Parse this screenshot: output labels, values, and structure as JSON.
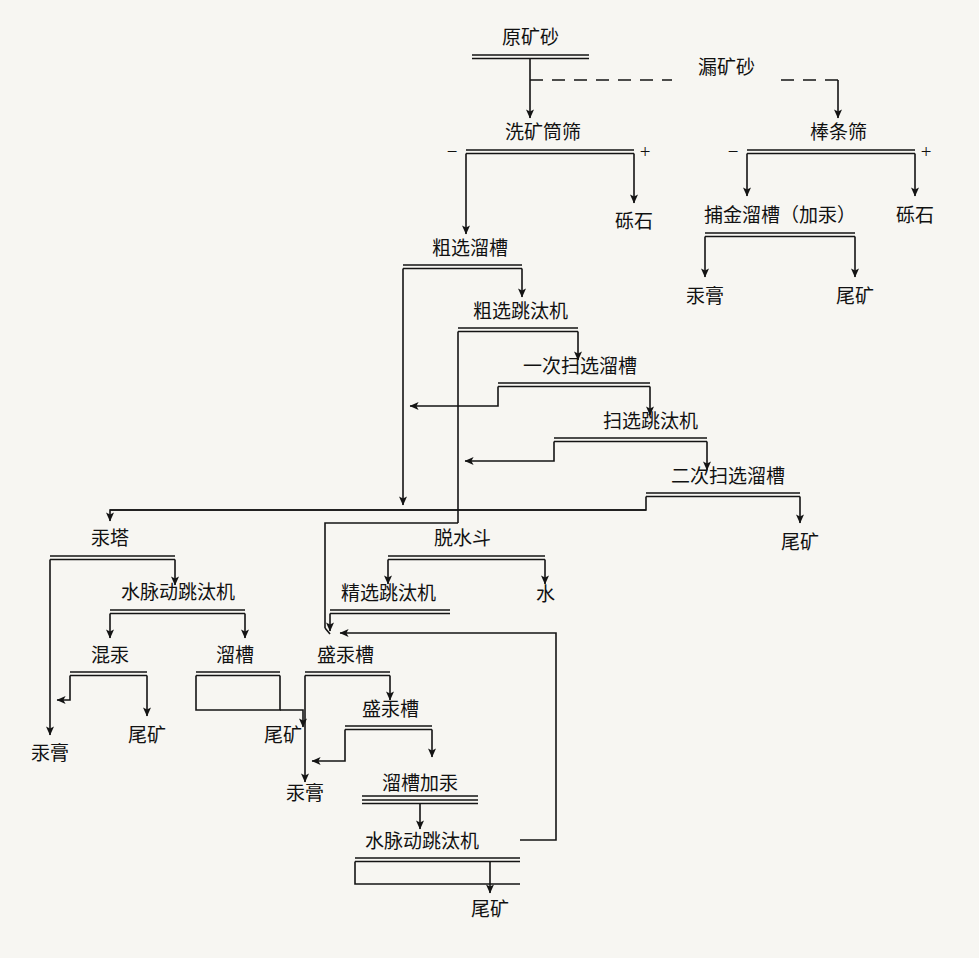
{
  "diagram": {
    "type": "process-flowchart",
    "language": "zh-CN",
    "colors": {
      "line": "#141414",
      "text": "#111111",
      "background": "#f7f6f2"
    },
    "signs": {
      "minus": "−",
      "plus": "+"
    }
  },
  "nodes": {
    "raw_ore": {
      "label": "原矿砂"
    },
    "wash_drum_screen": {
      "label": "洗矿筒筛",
      "minus": "−",
      "plus": "+"
    },
    "bar_screen": {
      "label": "棒条筛",
      "minus": "−",
      "plus": "+"
    },
    "gravel_left": {
      "label": "砾石"
    },
    "gravel_right": {
      "label": "砾石"
    },
    "gold_trap_sluice": {
      "label": "捕金溜槽（加汞）"
    },
    "amalgam_r": {
      "label": "汞膏"
    },
    "tailing_r": {
      "label": "尾矿"
    },
    "rough_sluice": {
      "label": "粗选溜槽"
    },
    "rough_jig": {
      "label": "粗选跳汰机"
    },
    "scav1_sluice": {
      "label": "一次扫选溜槽"
    },
    "scav_jig": {
      "label": "扫选跳汰机"
    },
    "scav2_sluice": {
      "label": "二次扫选溜槽"
    },
    "tailing_scav2": {
      "label": "尾矿"
    },
    "mercury_tower": {
      "label": "汞塔"
    },
    "pulse_jig_left": {
      "label": "水脉动跳汰机"
    },
    "mixed_mercury": {
      "label": "混汞"
    },
    "sluice_left": {
      "label": "溜槽"
    },
    "amalgam_l": {
      "label": "汞膏"
    },
    "tailing_mix": {
      "label": "尾矿"
    },
    "tailing_sluice_l": {
      "label": "尾矿"
    },
    "dewater_bucket": {
      "label": "脱水斗"
    },
    "water": {
      "label": "水"
    },
    "clean_jig": {
      "label": "精选跳汰机"
    },
    "merc_trough_1": {
      "label": "盛汞槽"
    },
    "merc_trough_2": {
      "label": "盛汞槽"
    },
    "amalgam_c": {
      "label": "汞膏"
    },
    "sluice_add_merc": {
      "label": "溜槽加汞"
    },
    "pulse_jig_bottom": {
      "label": "水脉动跳汰机"
    },
    "tailing_bottom": {
      "label": "尾矿"
    }
  },
  "edges": {
    "leak_ore": {
      "label": "漏矿砂",
      "style": "dashed"
    }
  },
  "flow_order": [
    "原矿砂",
    "洗矿筒筛",
    "棒条筛",
    "捕金溜槽（加汞）",
    "粗选溜槽",
    "粗选跳汰机",
    "一次扫选溜槽",
    "扫选跳汰机",
    "二次扫选溜槽",
    "汞塔",
    "水脉动跳汰机",
    "脱水斗",
    "精选跳汰机",
    "盛汞槽",
    "溜槽加汞"
  ]
}
